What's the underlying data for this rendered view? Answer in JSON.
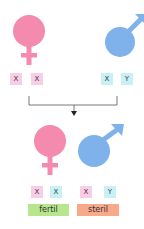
{
  "colors": {
    "female": "#f48aae",
    "male": "#7fb2ea",
    "chrom_female": "#f8cde6",
    "chrom_male": "#c9f1f5",
    "fertil": "#b7e68f",
    "steril": "#f7a98a",
    "line": "#555555"
  },
  "parents": {
    "female": {
      "symbol": "female-symbol",
      "chromosomes": [
        "X",
        "X"
      ]
    },
    "male": {
      "symbol": "male-symbol",
      "chromosomes": [
        "X",
        "Y"
      ]
    }
  },
  "offspring": [
    {
      "symbol": "female-symbol",
      "chromosomes": [
        "X",
        "X"
      ],
      "label": "fertil"
    },
    {
      "symbol": "male-symbol",
      "chromosomes": [
        "X",
        "Y"
      ],
      "label": "steril"
    }
  ]
}
